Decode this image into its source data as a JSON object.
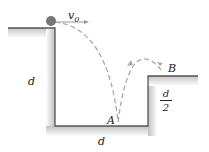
{
  "diagram": {
    "labels": {
      "initial_velocity": "v",
      "initial_velocity_sub": "0",
      "wall_height": "d",
      "floor_width": "d",
      "point_a": "A",
      "point_b": "B",
      "ledge_height_num": "d",
      "ledge_height_den": "2"
    },
    "colors": {
      "ground_shade": "#b8b8b8",
      "wall_line": "#555555",
      "trajectory": "#aaaaaa",
      "ball": "#777777"
    }
  }
}
